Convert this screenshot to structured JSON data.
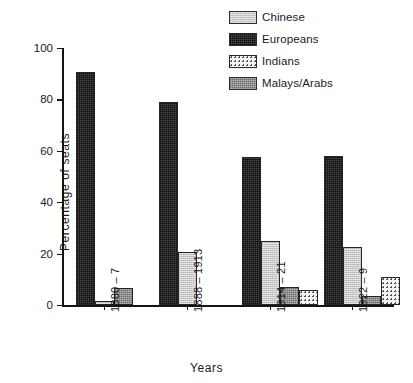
{
  "chart_data": {
    "type": "bar",
    "title": "",
    "xlabel": "Years",
    "ylabel": "Percentage of seats",
    "ylim": [
      0,
      100
    ],
    "yticks": [
      0,
      20,
      40,
      60,
      80,
      100
    ],
    "ytick_labels": [
      "0",
      "20",
      "40",
      "60",
      "80",
      "100"
    ],
    "grid": false,
    "legend_position": "top-right",
    "categories": [
      "1880 – 7",
      "1888 – 1913",
      "1914 – 21",
      "1922 – 9"
    ],
    "series": [
      {
        "name": "Chinese",
        "color": "#c9c9c9",
        "pattern": "light-hatch",
        "values": [
          1.5,
          20.5,
          25.0,
          22.5
        ]
      },
      {
        "name": "Europeans",
        "color": "#4a4a4a",
        "pattern": "dark-dense",
        "values": [
          90.5,
          79.0,
          57.5,
          58.0
        ]
      },
      {
        "name": "Indians",
        "color": "#f3f3f3",
        "pattern": "dotted",
        "values": [
          0,
          0,
          6.0,
          11.0
        ]
      },
      {
        "name": "Malays/Arabs",
        "color": "#8e8e8e",
        "pattern": "mid-hatch",
        "values": [
          6.5,
          0,
          7.0,
          3.5
        ]
      }
    ],
    "bar_order_within_group": [
      "Europeans",
      "Chinese",
      "Malays/Arabs",
      "Indians"
    ],
    "annotations": []
  },
  "legend": {
    "items": [
      {
        "label": "Chinese"
      },
      {
        "label": "Europeans"
      },
      {
        "label": "Indians"
      },
      {
        "label": "Malays/Arabs"
      }
    ]
  }
}
